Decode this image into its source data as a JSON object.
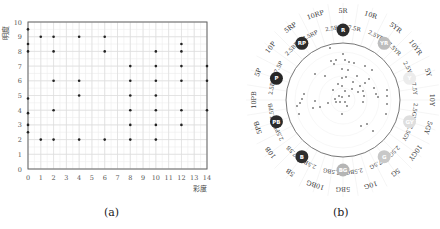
{
  "panel_a": {
    "caption": "(a)",
    "ylabel": "明度",
    "xlabel": "彩度"
  },
  "panel_b": {
    "caption": "(b)"
  },
  "chart_data": [
    {
      "type": "scatter",
      "title": "",
      "xlabel": "彩度",
      "ylabel": "明度",
      "xlim": [
        0,
        14
      ],
      "ylim": [
        0,
        10
      ],
      "xticks": [
        0,
        1,
        2,
        3,
        4,
        5,
        6,
        7,
        8,
        9,
        10,
        11,
        12,
        13,
        14
      ],
      "yticks": [
        0,
        1,
        2,
        3,
        4,
        5,
        6,
        7,
        8,
        9,
        10
      ],
      "grid": true,
      "points": [
        [
          0,
          9.5
        ],
        [
          0,
          8.5
        ],
        [
          0,
          8
        ],
        [
          0,
          4.8
        ],
        [
          0,
          3.8
        ],
        [
          0,
          3
        ],
        [
          0,
          2.5
        ],
        [
          1,
          9
        ],
        [
          1,
          2
        ],
        [
          2,
          9
        ],
        [
          2,
          8
        ],
        [
          2,
          6
        ],
        [
          2,
          4
        ],
        [
          2,
          2
        ],
        [
          4,
          9
        ],
        [
          4,
          6
        ],
        [
          4,
          5
        ],
        [
          4,
          2
        ],
        [
          6,
          9
        ],
        [
          6,
          8
        ],
        [
          6,
          2
        ],
        [
          8,
          7
        ],
        [
          8,
          6
        ],
        [
          8,
          5
        ],
        [
          8,
          4
        ],
        [
          8,
          3
        ],
        [
          8,
          2
        ],
        [
          10,
          8
        ],
        [
          10,
          7
        ],
        [
          10,
          6
        ],
        [
          10,
          5
        ],
        [
          10,
          4
        ],
        [
          10,
          3
        ],
        [
          10,
          2
        ],
        [
          12,
          8.5
        ],
        [
          12,
          8
        ],
        [
          12,
          7
        ],
        [
          12,
          6
        ],
        [
          12,
          4
        ],
        [
          12,
          3
        ],
        [
          14,
          7
        ],
        [
          14,
          6
        ],
        [
          14,
          4
        ]
      ]
    },
    {
      "type": "scatter",
      "subtype": "polar-hue-circle",
      "title": "",
      "hue_labels_outer": [
        "5R",
        "10R",
        "5YR",
        "10YR",
        "5Y",
        "10Y",
        "5GY",
        "10GY",
        "5G",
        "10G",
        "5BG",
        "10BG",
        "5B",
        "10B",
        "5PB",
        "10PB",
        "5P",
        "10P",
        "5RP",
        "10RP"
      ],
      "hue_labels_inner": [
        "7.5R",
        "2.5YR",
        "7.5YR",
        "2.5Y",
        "7.5Y",
        "2.5GY",
        "7.5GY",
        "2.5G",
        "7.5G",
        "2.5BG",
        "7.5BG",
        "2.5B",
        "7.5B",
        "2.5PB",
        "7.5PB",
        "2.5P",
        "7.5P",
        "2.5RP",
        "7.5RP",
        "2.5R"
      ],
      "principal_hues": [
        {
          "code": "R",
          "color": "#2b2b2b"
        },
        {
          "code": "YR",
          "color": "#bdbdbd"
        },
        {
          "code": "Y",
          "color": "#ececec"
        },
        {
          "code": "GY",
          "color": "#dedede"
        },
        {
          "code": "G",
          "color": "#c8c8c8"
        },
        {
          "code": "BG",
          "color": "#b5b5b5"
        },
        {
          "code": "B",
          "color": "#2e2e2e"
        },
        {
          "code": "PB",
          "color": "#2b2b2b"
        },
        {
          "code": "P",
          "color": "#262626"
        },
        {
          "code": "RP",
          "color": "#2b2b2b"
        }
      ],
      "points_xy_relative": [
        [
          -13,
          -52
        ],
        [
          0,
          -46
        ],
        [
          -7,
          -40
        ],
        [
          2,
          -40
        ],
        [
          6,
          -38
        ],
        [
          -12,
          -39
        ],
        [
          11,
          -37
        ],
        [
          22,
          -34
        ],
        [
          29,
          -30
        ],
        [
          -1,
          -31
        ],
        [
          5,
          -30
        ],
        [
          -28,
          -26
        ],
        [
          -18,
          -24
        ],
        [
          -1,
          -22
        ],
        [
          3,
          -23
        ],
        [
          14,
          -24
        ],
        [
          26,
          -21
        ],
        [
          10,
          -18
        ],
        [
          -5,
          -16
        ],
        [
          17,
          -14
        ],
        [
          22,
          -17
        ],
        [
          31,
          -12
        ],
        [
          -1,
          -14
        ],
        [
          -10,
          -10
        ],
        [
          2,
          -9
        ],
        [
          9,
          -11
        ],
        [
          15,
          -8
        ],
        [
          20,
          -9
        ],
        [
          33,
          -6
        ],
        [
          44,
          -10
        ],
        [
          -4,
          -4
        ],
        [
          -8,
          -1
        ],
        [
          -1,
          -3
        ],
        [
          6,
          -4
        ],
        [
          21,
          -4
        ],
        [
          35,
          -3
        ],
        [
          44,
          -4
        ],
        [
          -15,
          3
        ],
        [
          -7,
          2
        ],
        [
          -3,
          2
        ],
        [
          2,
          2
        ],
        [
          4,
          6
        ],
        [
          20,
          2
        ],
        [
          44,
          4
        ],
        [
          -39,
          -6
        ],
        [
          -46,
          6
        ],
        [
          -43,
          3
        ],
        [
          -28,
          1
        ],
        [
          -30,
          8
        ],
        [
          -23,
          7
        ],
        [
          -44,
          14
        ],
        [
          -1,
          14
        ],
        [
          43,
          14
        ],
        [
          24,
          24
        ],
        [
          18,
          26
        ],
        [
          30,
          31
        ],
        [
          -41,
          -1
        ],
        [
          -9,
          -36
        ]
      ]
    }
  ]
}
